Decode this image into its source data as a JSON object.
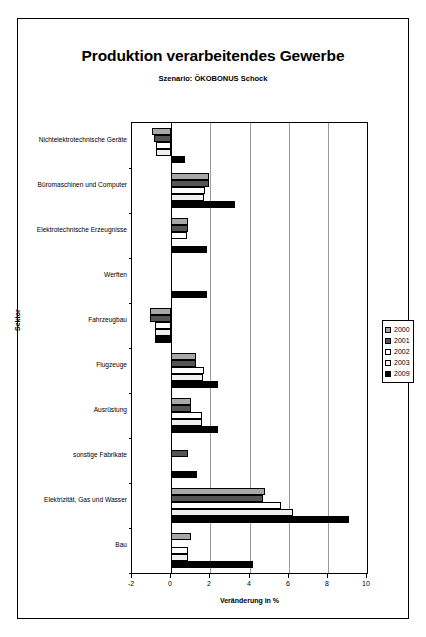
{
  "chart_data": {
    "type": "bar",
    "orientation": "horizontal",
    "title": "Produktion verarbeitendes Gewerbe",
    "subtitle": "Szenario: ÖKOBONUS Schock",
    "xlabel": "Veränderung in %",
    "ylabel": "Sektor",
    "xlim": [
      -2,
      10
    ],
    "xticks": [
      -2,
      0,
      2,
      4,
      6,
      8,
      10
    ],
    "xtick_labels": [
      "-2",
      "0",
      "2",
      "4",
      "6",
      "8",
      "10"
    ],
    "grid": "vertical",
    "legend_position": "right",
    "categories": [
      "Nichtelektrotechnische Geräte",
      "Büromaschinen und Computer",
      "Elektrotechnische Erzeugnisse",
      "Werften",
      "Fahrzeugbau",
      "Flugzeuge",
      "Ausrüstung",
      "sonstige Fabrikate",
      "Elektrizität, Gas und Wasser",
      "Bau"
    ],
    "series": [
      {
        "name": "2000",
        "color": "#a8a8a8",
        "values": [
          -1.0,
          1.95,
          0.85,
          0.0,
          -1.1,
          1.25,
          1.0,
          0.0,
          4.8,
          1.0
        ]
      },
      {
        "name": "2001",
        "color": "#555555",
        "values": [
          -0.9,
          1.95,
          0.85,
          0.0,
          -1.1,
          1.25,
          1.0,
          0.85,
          4.7,
          0.0
        ]
      },
      {
        "name": "2002",
        "color": "#ffffff",
        "values": [
          -0.8,
          1.75,
          0.8,
          0.0,
          -0.85,
          1.7,
          1.6,
          0.0,
          5.6,
          0.85
        ]
      },
      {
        "name": "2003",
        "color": "#f0f0f0",
        "values": [
          -0.75,
          1.7,
          0.0,
          0.0,
          -0.85,
          1.65,
          1.55,
          0.0,
          6.2,
          0.85
        ]
      },
      {
        "name": "2009",
        "color": "#000000",
        "values": [
          0.7,
          3.25,
          1.85,
          1.85,
          -0.85,
          2.4,
          2.4,
          1.3,
          9.1,
          4.2
        ]
      }
    ]
  }
}
